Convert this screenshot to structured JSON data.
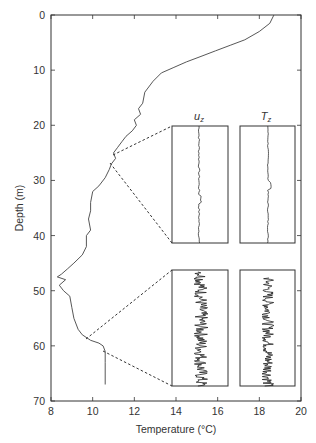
{
  "chart_data": {
    "type": "line",
    "title": "",
    "xlabel": "Temperature (°C)",
    "ylabel": "Depth (m)",
    "xlim": [
      8,
      20
    ],
    "ylim": [
      70,
      0
    ],
    "y_inverted": true,
    "grid": false,
    "x_ticks": [
      8,
      10,
      12,
      14,
      16,
      18,
      20
    ],
    "y_ticks": [
      0,
      10,
      20,
      30,
      40,
      50,
      60,
      70
    ],
    "series": [
      {
        "name": "Temperature profile",
        "x": [
          18.7,
          18.5,
          18.0,
          17.3,
          16.6,
          15.9,
          15.2,
          14.5,
          13.9,
          13.3,
          12.9,
          12.5,
          12.4,
          12.2,
          12.3,
          12.0,
          12.1,
          11.9,
          11.6,
          11.4,
          11.2,
          11.0,
          11.1,
          10.9,
          10.8,
          10.6,
          10.3,
          10.0,
          9.9,
          9.9,
          9.8,
          9.9,
          9.7,
          9.7,
          9.5,
          9.1,
          8.8,
          8.5,
          8.3,
          8.7,
          8.4,
          8.6,
          8.9,
          9.0,
          9.1,
          9.3,
          9.5,
          9.9,
          10.3,
          10.5,
          10.6,
          10.6,
          10.6
        ],
        "depth": [
          0,
          1.5,
          3,
          4.5,
          5.5,
          6.5,
          7.5,
          8.5,
          9.5,
          10.5,
          12,
          14,
          16,
          17,
          18,
          19,
          20,
          21,
          22,
          23,
          24,
          25,
          26,
          27,
          28,
          29.5,
          31,
          32,
          34,
          35.5,
          37,
          39,
          40,
          42,
          43.5,
          45,
          46,
          47,
          47.5,
          48,
          49,
          50,
          51,
          53,
          55,
          57,
          58,
          59,
          59.5,
          60,
          61,
          63,
          67
        ]
      }
    ],
    "insets": [
      {
        "position": "upper",
        "depth_range_zoomed": [
          25,
          27
        ],
        "panels": [
          {
            "label": "u_z",
            "description": "Low-variance vertical velocity, nearly straight trace"
          },
          {
            "label": "T_z",
            "description": "Low-variance temperature gradient, nearly straight trace"
          }
        ]
      },
      {
        "position": "lower",
        "depth_range_zoomed": [
          59,
          61
        ],
        "panels": [
          {
            "label": "u_z",
            "description": "High-variance vertical velocity, noisy trace"
          },
          {
            "label": "T_z",
            "description": "High-variance temperature gradient, noisy trace"
          }
        ]
      }
    ]
  },
  "labels": {
    "xlabel": "Temperature (°C)",
    "ylabel": "Depth (m)",
    "inset_u_main": "u",
    "inset_u_sub": "z",
    "inset_t_main": "T",
    "inset_t_sub": "z"
  },
  "x_tick_labels": [
    "8",
    "10",
    "12",
    "14",
    "16",
    "18",
    "20"
  ],
  "y_tick_labels": [
    "0",
    "10",
    "20",
    "30",
    "40",
    "50",
    "60",
    "70"
  ]
}
